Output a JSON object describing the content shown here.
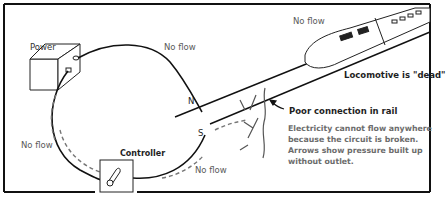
{
  "diagram": {
    "type": "electric-circuit-illustration",
    "labels": {
      "power": "Power",
      "controller": "Controller",
      "no_flow_top": "No flow",
      "no_flow_train": "No flow",
      "no_flow_left": "No flow",
      "no_flow_bottom": "No flow",
      "rail_n": "N",
      "rail_s": "S",
      "locomotive": "Locomotive is \"dead\"",
      "poor_connection": "Poor connection in rail"
    },
    "note_lines": [
      "Electricity cannot flow anywhere",
      "because the circuit is broken.",
      "Arrows show pressure built up",
      "without outlet."
    ],
    "icons": {
      "power_box": "power-supply-box",
      "controller_box": "controller-box",
      "locomotive": "train-locomotive",
      "break": "rail-break-crack",
      "arrows": "dashed-pressure-arrows"
    },
    "colors": {
      "line": "#111111",
      "dashed_arrow": "#6a6a6a",
      "text": "#555555"
    }
  }
}
